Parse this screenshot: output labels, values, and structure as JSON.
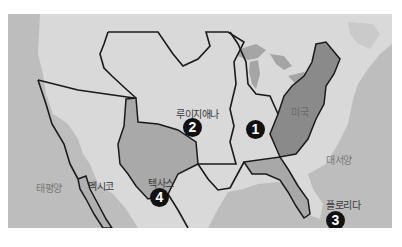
{
  "map": {
    "title": "",
    "colors": {
      "ocean": "#bdbdbd",
      "land": "#d9d9d9",
      "original_states": "#8a8a8a",
      "florida": "#a8a8a8",
      "texas": "#a9a9a9",
      "lakes": "#a5a5a5",
      "border": "#1a1a1a"
    },
    "labels": {
      "louisiana": "루이지애나",
      "mexico": "멕시코",
      "texas": "텍사스",
      "florida": "플로리다",
      "usa": "미국",
      "atlantic": "대서양",
      "pacific": "태평양"
    },
    "markers": [
      {
        "id": "1",
        "label": "1",
        "region": "original-territory"
      },
      {
        "id": "2",
        "label": "2",
        "region": "louisiana"
      },
      {
        "id": "3",
        "label": "3",
        "region": "florida"
      },
      {
        "id": "4",
        "label": "4",
        "region": "texas"
      }
    ]
  }
}
